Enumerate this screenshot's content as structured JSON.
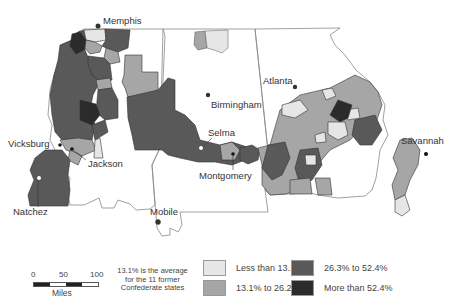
{
  "map": {
    "title": "",
    "colors": {
      "less_than_13_1": "#e6e6e6",
      "13_1_to_26_2": "#a6a6a6",
      "26_3_to_52_4": "#595959",
      "more_than_52_4": "#2b2b2b",
      "state_border": "#888888",
      "cluster_border": "#333333"
    },
    "cities": [
      {
        "name": "Memphis",
        "marker": "filled"
      },
      {
        "name": "Atlanta",
        "marker": "filled"
      },
      {
        "name": "Birmingham",
        "marker": "filled"
      },
      {
        "name": "Selma",
        "marker": "open"
      },
      {
        "name": "Vicksburg",
        "marker": "filled"
      },
      {
        "name": "Jackson",
        "marker": "filled"
      },
      {
        "name": "Montgomery",
        "marker": "filled"
      },
      {
        "name": "Savannah",
        "marker": "filled"
      },
      {
        "name": "Natchez",
        "marker": "open"
      },
      {
        "name": "Mobile",
        "marker": "filled"
      }
    ]
  },
  "scale_bar": {
    "ticks": [
      "0",
      "50",
      "100"
    ],
    "unit": "Miles"
  },
  "note": "13.1% is the average for the 11 former Confederate states",
  "legend": {
    "items": [
      {
        "label": "Less than 13.1%",
        "color": "#e6e6e6"
      },
      {
        "label": "13.1% to 26.2%",
        "color": "#a6a6a6"
      },
      {
        "label": "26.3% to 52.4%",
        "color": "#595959"
      },
      {
        "label": "More than 52.4%",
        "color": "#2b2b2b"
      }
    ]
  }
}
